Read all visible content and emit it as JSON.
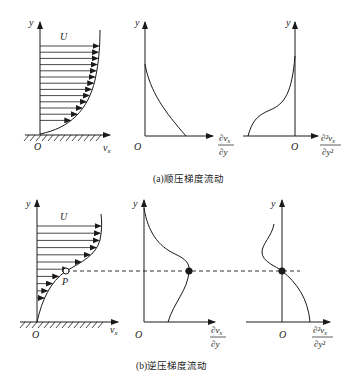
{
  "figure": {
    "panel_a": {
      "caption": "(a)顺压梯度流动",
      "velocity_profile": {
        "y_label": "y",
        "x_label": "v",
        "x_sub": "x",
        "origin": "O",
        "freestream": "U"
      },
      "first_derivative": {
        "y_label": "y",
        "origin": "O",
        "x_label_num": "∂v",
        "x_label_num_sub": "x",
        "x_label_den": "∂y"
      },
      "second_derivative": {
        "y_label": "y",
        "origin": "O",
        "x_label_num": "∂²v",
        "x_label_num_sub": "x",
        "x_label_den": "∂y²"
      }
    },
    "panel_b": {
      "caption": "(b)逆压梯度流动",
      "velocity_profile": {
        "y_label": "y",
        "x_label": "v",
        "x_sub": "x",
        "origin": "O",
        "freestream": "U",
        "inflection_point": "P"
      },
      "first_derivative": {
        "y_label": "y",
        "origin": "O",
        "x_label_num": "∂v",
        "x_label_num_sub": "x",
        "x_label_den": "∂y"
      },
      "second_derivative": {
        "y_label": "y",
        "origin": "O",
        "x_label_num": "∂²v",
        "x_label_num_sub": "x",
        "x_label_den": "∂y²"
      }
    }
  }
}
